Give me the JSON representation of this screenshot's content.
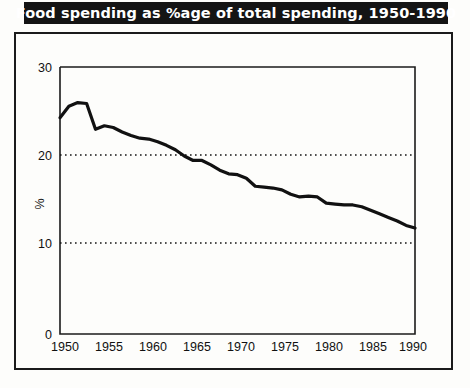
{
  "title": "Food spending as %age of total spending, 1950-1990",
  "chart_data": {
    "type": "line",
    "title": "Food spending as %age of total spending, 1950-1990",
    "xlabel": "",
    "ylabel": "%",
    "xlim": [
      1950,
      1990
    ],
    "ylim": [
      0,
      30
    ],
    "yticks": [
      0,
      10,
      20,
      30
    ],
    "ytick_labels": [
      "0",
      "10",
      "20",
      "30"
    ],
    "xticks": [
      1950,
      1955,
      1960,
      1965,
      1970,
      1975,
      1980,
      1985,
      1990
    ],
    "xtick_labels": [
      "1950",
      "1955",
      "1960",
      "1965",
      "1970",
      "1975",
      "1980",
      "1985",
      "1990"
    ],
    "gridlines_y": [
      10,
      20
    ],
    "grid_style": "dotted",
    "legend": "none",
    "line_color": "#111111",
    "series": [
      {
        "name": "Food spending as % of total spending",
        "x": [
          1950,
          1951,
          1952,
          1953,
          1954,
          1955,
          1956,
          1957,
          1958,
          1959,
          1960,
          1961,
          1962,
          1963,
          1964,
          1965,
          1966,
          1967,
          1968,
          1969,
          1970,
          1971,
          1972,
          1973,
          1974,
          1975,
          1976,
          1977,
          1978,
          1979,
          1980,
          1981,
          1982,
          1983,
          1984,
          1985,
          1986,
          1987,
          1988,
          1989,
          1990
        ],
        "values": [
          24.3,
          25.6,
          26.0,
          25.9,
          23.0,
          23.4,
          23.2,
          22.7,
          22.3,
          22.0,
          21.9,
          21.6,
          21.2,
          20.7,
          20.0,
          19.5,
          19.5,
          19.0,
          18.4,
          18.0,
          17.9,
          17.5,
          16.6,
          16.5,
          16.4,
          16.2,
          15.7,
          15.4,
          15.5,
          15.4,
          14.7,
          14.6,
          14.5,
          14.5,
          14.3,
          13.9,
          13.5,
          13.1,
          12.7,
          12.2,
          11.9
        ]
      }
    ]
  },
  "axes": {
    "y_axis_label": "%",
    "y_tick_30": "30",
    "y_tick_20": "20",
    "y_tick_10": "10",
    "y_tick_0": "0",
    "x_tick_1950": "1950",
    "x_tick_1955": "1955",
    "x_tick_1960": "1960",
    "x_tick_1965": "1965",
    "x_tick_1970": "1970",
    "x_tick_1975": "1975",
    "x_tick_1980": "1980",
    "x_tick_1985": "1985",
    "x_tick_1990": "1990"
  },
  "colors": {
    "banner_bg": "#141414",
    "banner_text": "#ffffff",
    "line": "#111111",
    "frame": "#1b1b1b",
    "page_bg": "#fdfdfb"
  }
}
